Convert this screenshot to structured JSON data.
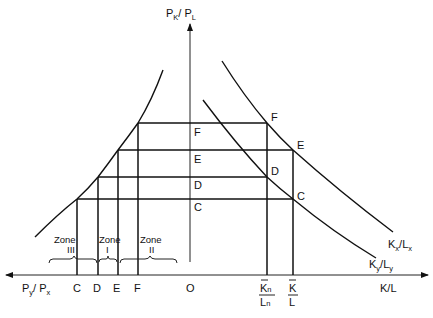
{
  "diagram": {
    "vertical_axis": {
      "label_main": "P",
      "label_sub1": "K",
      "label_sep": "/ P",
      "label_sub2": "L"
    },
    "horizontal_axis_right": {
      "label": "K/L"
    },
    "horizontal_axis_left": {
      "label_main": "P",
      "label_sub1": "y",
      "label_sep": "/ P",
      "label_sub2": "x"
    },
    "origin": "O",
    "price_levels": [
      "F",
      "E",
      "D",
      "C"
    ],
    "left_axis_points": [
      "C",
      "D",
      "E",
      "F"
    ],
    "ratio_labels": {
      "kn_top": "K",
      "kn_top_sub": "n",
      "kn_bottom": "L",
      "kn_bottom_sub": "n",
      "k_top": "K",
      "k_bottom": "L"
    },
    "curves": {
      "kx_lx": {
        "main1": "K",
        "sub1": "x",
        "sep": "/",
        "main2": "L",
        "sub2": "x"
      },
      "ky_ly": {
        "main1": "K",
        "sub1": "y",
        "sep": "/",
        "main2": "L",
        "sub2": "y"
      }
    },
    "curve_points": {
      "F": "F",
      "E": "E",
      "D": "D",
      "C": "C"
    },
    "zones": [
      {
        "name": "Zone",
        "numeral": "III"
      },
      {
        "name": "Zone",
        "numeral": "I"
      },
      {
        "name": "Zone",
        "numeral": "II"
      }
    ]
  }
}
